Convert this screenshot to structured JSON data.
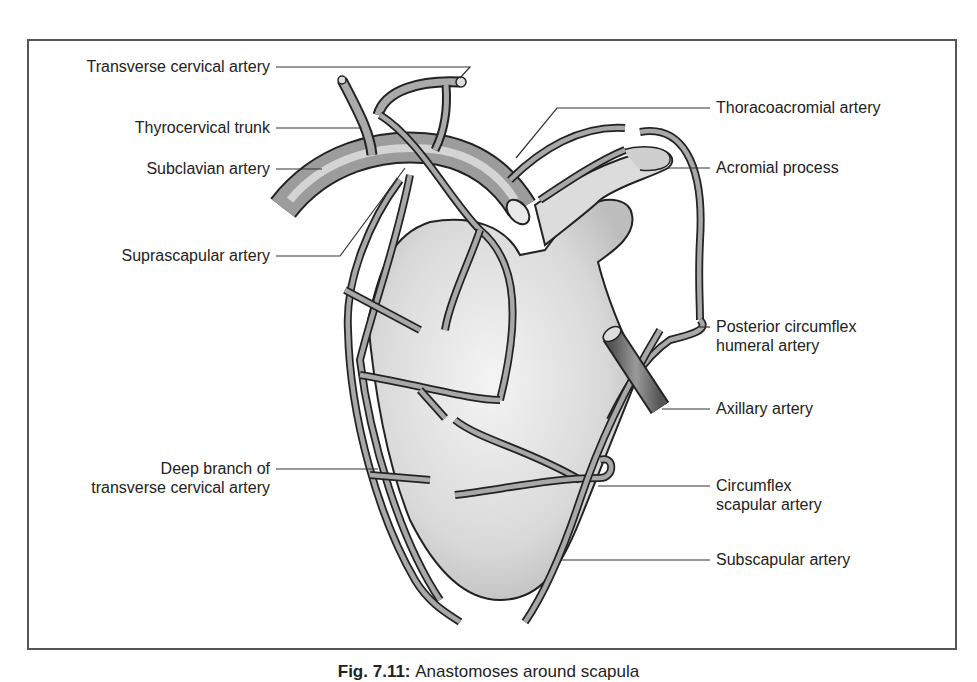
{
  "figure": {
    "caption_number": "Fig. 7.11:",
    "caption_text": "Anastomoses around scapula",
    "labels_left": [
      {
        "id": "transverse-cervical",
        "text": "Transverse cervical artery"
      },
      {
        "id": "thyrocervical",
        "text": "Thyrocervical trunk"
      },
      {
        "id": "subclavian",
        "text": "Subclavian artery"
      },
      {
        "id": "suprascapular",
        "text": "Suprascapular artery"
      },
      {
        "id": "deep-branch",
        "line1": "Deep branch of",
        "line2": "transverse cervical artery"
      }
    ],
    "labels_right": [
      {
        "id": "thoracoacromial",
        "text": "Thoracoacromial artery"
      },
      {
        "id": "acromial",
        "text": "Acromial process"
      },
      {
        "id": "posterior-circumflex",
        "line1": "Posterior circumflex",
        "line2": "humeral artery"
      },
      {
        "id": "axillary",
        "text": "Axillary artery"
      },
      {
        "id": "circumflex-scapular",
        "line1": "Circumflex",
        "line2": "scapular artery"
      },
      {
        "id": "subscapular",
        "text": "Subscapular artery"
      }
    ]
  }
}
